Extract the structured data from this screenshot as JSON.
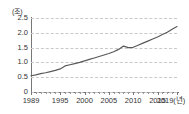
{
  "chart_data": {
    "type": "line",
    "title": "",
    "subtitle": "",
    "xlabel": "(년)",
    "ylabel": "(조)",
    "y_unit_label": "(조)",
    "x_unit_label": "(년)",
    "grid": true,
    "legend": false,
    "legend_position": "none",
    "line_color": "#595959",
    "grid_color": "#c9c9c9",
    "axis_color": "#777777",
    "text_color": "#333333",
    "xlim": [
      1989,
      2019
    ],
    "ylim": [
      0,
      2.5
    ],
    "y_ticks": [
      "2.5",
      "2.0",
      "1.5",
      "1.0",
      "0.5",
      "0"
    ],
    "y_tick_values": [
      2.5,
      2.0,
      1.5,
      1.0,
      0.5,
      0
    ],
    "x_ticks": [
      "1989",
      "1995",
      "2000",
      "2005",
      "2010",
      "2015",
      "2019(년)"
    ],
    "x_tick_values": [
      1989,
      1995,
      2000,
      2005,
      2010,
      2015,
      2019
    ],
    "x": [
      1989,
      1990,
      1991,
      1992,
      1993,
      1994,
      1995,
      1996,
      1997,
      1998,
      1999,
      2000,
      2001,
      2002,
      2003,
      2004,
      2005,
      2006,
      2007,
      2008,
      2009,
      2010,
      2011,
      2012,
      2013,
      2014,
      2015,
      2016,
      2017,
      2018,
      2019
    ],
    "series": [
      {
        "name": "",
        "values": [
          0.55,
          0.58,
          0.62,
          0.65,
          0.69,
          0.73,
          0.78,
          0.88,
          0.92,
          0.96,
          1.0,
          1.05,
          1.1,
          1.15,
          1.2,
          1.25,
          1.3,
          1.36,
          1.44,
          1.55,
          1.5,
          1.51,
          1.58,
          1.65,
          1.72,
          1.79,
          1.86,
          1.94,
          2.02,
          2.12,
          2.21
        ]
      }
    ]
  },
  "axes": {
    "y_unit": "(조)",
    "x_unit": "(년)"
  }
}
